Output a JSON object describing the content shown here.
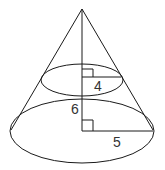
{
  "diagram": {
    "type": "geometry",
    "labels": {
      "upper_radius": "4",
      "height_between_sections": "6",
      "base_radius": "5"
    },
    "colors": {
      "stroke": "#1a1a1a",
      "label": "#333333",
      "background": "#ffffff"
    }
  }
}
